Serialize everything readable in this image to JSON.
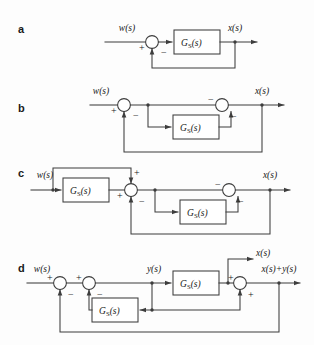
{
  "figure": {
    "background_color": "#fdfdfd",
    "line_color": "#3d3d3d",
    "text_color": "#1a1a1a",
    "width": 314,
    "height": 345
  },
  "panels": [
    {
      "id": "a",
      "letter": "a",
      "input_label": "w(s)",
      "output_label": "x(s)",
      "blocks": [
        {
          "name": "Gs-block-a",
          "base": "G",
          "subscript": "S",
          "arg": "(s)"
        }
      ],
      "summing_junctions": [
        {
          "name": "sum-a1",
          "signs": [
            "+",
            "−"
          ]
        }
      ]
    },
    {
      "id": "b",
      "letter": "b",
      "input_label": "w(s)",
      "output_label": "x(s)",
      "blocks": [
        {
          "name": "Gs-block-b",
          "base": "G",
          "subscript": "S",
          "arg": "(s)"
        }
      ],
      "summing_junctions": [
        {
          "name": "sum-b1",
          "signs": [
            "+",
            "−"
          ]
        },
        {
          "name": "sum-b2",
          "signs": [
            "−",
            "−"
          ]
        }
      ]
    },
    {
      "id": "c",
      "letter": "c",
      "input_label": "w(s)",
      "output_label": "x(s)",
      "blocks": [
        {
          "name": "Gs-block-c1",
          "base": "G",
          "subscript": "S",
          "arg": "(s)"
        },
        {
          "name": "Gs-block-c2",
          "base": "G",
          "subscript": "S",
          "arg": "(s)"
        }
      ],
      "summing_junctions": [
        {
          "name": "sum-c1",
          "signs": [
            "+",
            "+",
            "−"
          ]
        },
        {
          "name": "sum-c2",
          "signs": [
            "−",
            "−"
          ]
        }
      ]
    },
    {
      "id": "d",
      "letter": "d",
      "input_label": "w(s)",
      "intermediate_label": "y(s)",
      "branch_label": "x(s)",
      "output_label": "x(s)+y(s)",
      "blocks": [
        {
          "name": "Gs-block-d1",
          "base": "G",
          "subscript": "S",
          "arg": "(s)"
        },
        {
          "name": "Gs-block-d2",
          "base": "G",
          "subscript": "S",
          "arg": "(s)"
        }
      ],
      "summing_junctions": [
        {
          "name": "sum-d1",
          "signs": [
            "+",
            "−"
          ]
        },
        {
          "name": "sum-d2",
          "signs": [
            "+",
            "−"
          ]
        },
        {
          "name": "sum-d3",
          "signs": [
            "+",
            "+"
          ]
        }
      ]
    }
  ],
  "glyphs": {
    "plus": "+",
    "minus": "−"
  }
}
